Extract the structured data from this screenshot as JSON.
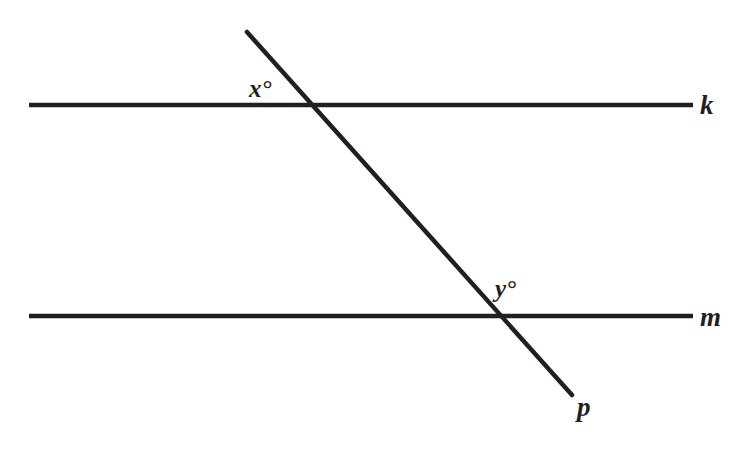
{
  "figure": {
    "background_color": "#ffffff",
    "stroke_color": "#231f20",
    "stroke_width": 4.5,
    "width": 741,
    "height": 461
  },
  "lines": [
    {
      "id": "line-k",
      "label": "k",
      "kind": "parallel-line",
      "orientation": "horizontal",
      "x1": 29,
      "y1": 105,
      "x2": 693,
      "y2": 105,
      "label_x": 700,
      "label_y": 92
    },
    {
      "id": "line-m",
      "label": "m",
      "kind": "parallel-line",
      "orientation": "horizontal",
      "x1": 29,
      "y1": 316,
      "x2": 693,
      "y2": 316,
      "label_x": 700,
      "label_y": 304
    },
    {
      "id": "line-p",
      "label": "p",
      "kind": "transversal",
      "orientation": "diagonal",
      "x1": 247,
      "y1": 32,
      "x2": 572,
      "y2": 395,
      "label_x": 577,
      "label_y": 394
    }
  ],
  "angles": [
    {
      "id": "angle-x",
      "label": "x°",
      "variable": "x",
      "unit": "degrees",
      "at_line": "k",
      "position": "above-left",
      "label_x": 249,
      "label_y": 76
    },
    {
      "id": "angle-y",
      "label": "y°",
      "variable": "y",
      "unit": "degrees",
      "at_line": "m",
      "position": "above-right",
      "label_x": 495,
      "label_y": 276
    }
  ],
  "intersections": [
    {
      "id": "intersection-k-p",
      "lines": [
        "k",
        "p"
      ],
      "x": 318,
      "y": 105
    },
    {
      "id": "intersection-m-p",
      "lines": [
        "m",
        "p"
      ],
      "x": 494,
      "y": 316
    }
  ]
}
